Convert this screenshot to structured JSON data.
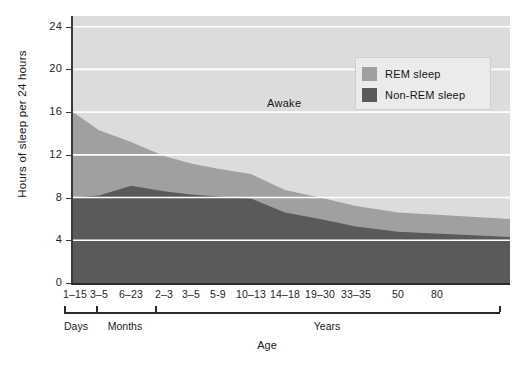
{
  "chart_data": {
    "type": "area",
    "title": "",
    "xlabel": "Age",
    "ylabel": "Hours of sleep per 24 hours",
    "ylim": [
      0,
      25
    ],
    "yticks": [
      0,
      4,
      8,
      12,
      16,
      20,
      24
    ],
    "ytick_labels": [
      "0",
      "4",
      "8",
      "12",
      "16",
      "20",
      "24"
    ],
    "grid": "horizontal-white",
    "stacked": true,
    "legend_position": "top-right",
    "categories": [
      "1–15",
      "3–5",
      "6–23",
      "2–3",
      "3–5",
      "5-9",
      "10–13",
      "14–18",
      "19–30",
      "33–35",
      "50",
      "80"
    ],
    "category_groups": [
      {
        "label": "Days",
        "from": "1–15",
        "to": "1–15"
      },
      {
        "label": "Months",
        "from": "3–5",
        "to": "6–23"
      },
      {
        "label": "Years",
        "from": "2–3",
        "to": "80"
      }
    ],
    "series": [
      {
        "name": "Non-REM sleep",
        "color": "#5a5a5a",
        "values": [
          8.0,
          8.2,
          9.1,
          8.6,
          8.3,
          8.1,
          7.9,
          6.6,
          6.0,
          5.3,
          4.8,
          4.3
        ]
      },
      {
        "name": "REM sleep",
        "color": "#a0a0a0",
        "values": [
          8.0,
          6.1,
          4.1,
          3.3,
          2.9,
          2.6,
          2.3,
          2.1,
          2.0,
          1.9,
          1.8,
          1.7
        ]
      },
      {
        "name": "Awake",
        "color": "#dcdcdc",
        "values": [
          8.0,
          9.7,
          10.8,
          12.1,
          12.8,
          13.3,
          13.8,
          15.3,
          16.0,
          16.8,
          17.4,
          18.0
        ]
      }
    ],
    "annotations": [
      {
        "text": "Awake",
        "x_pixel": 285,
        "y_pixel": 97
      }
    ],
    "legend": [
      {
        "label": "REM sleep",
        "color": "#a0a0a0"
      },
      {
        "label": "Non-REM sleep",
        "color": "#5a5a5a"
      }
    ]
  },
  "colors": {
    "awake": "#dcdcdc",
    "rem": "#a0a0a0",
    "nonrem": "#5a5a5a",
    "gridline": "#ffffff",
    "axis": "#2b2b2b",
    "legend_bg": "#ebebeb"
  }
}
